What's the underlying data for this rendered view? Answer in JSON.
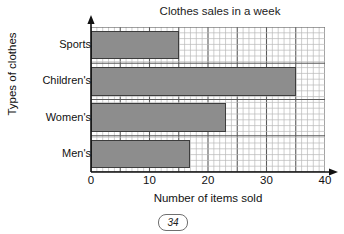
{
  "page": {
    "number": "34"
  },
  "chart_data": {
    "type": "bar",
    "orientation": "horizontal",
    "title": "Clothes sales in a week",
    "xlabel": "Number of items sold",
    "ylabel": "Types of clothes",
    "categories": [
      "Men's",
      "Women's",
      "Children's",
      "Sports"
    ],
    "values": [
      17,
      23,
      35,
      15
    ],
    "xlim": [
      0,
      40
    ],
    "xticks": [
      0,
      10,
      20,
      30,
      40
    ],
    "xticklabels": [
      "0",
      "10",
      "20",
      "30",
      "40"
    ],
    "minor_tick_step": 1,
    "major_grid_step": 5,
    "grid": true,
    "legend": null,
    "colors": {
      "bar_fill": "#8d8d8d",
      "bar_edge": "#3d3d3d",
      "minor_grid": "#b9b9b9",
      "major_grid": "#5a5a5a",
      "axis": "#111111"
    }
  },
  "axis_ticks": {
    "x": [
      "0",
      "10",
      "20",
      "30",
      "40"
    ],
    "y": [
      "Sports",
      "Children's",
      "Women's",
      "Men's"
    ]
  }
}
